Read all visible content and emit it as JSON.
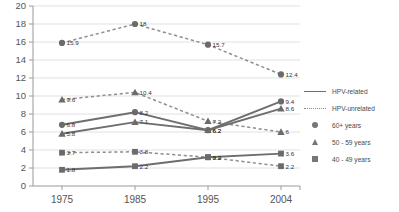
{
  "chart_data": {
    "type": "line",
    "title": "",
    "subtitle": "",
    "xlabel": "",
    "ylabel": "",
    "x": [
      "1975",
      "1985",
      "1995",
      "2004"
    ],
    "categories": [
      "1975",
      "1985",
      "1995",
      "2004"
    ],
    "ylim": [
      0,
      20
    ],
    "ytick_step": 2,
    "yticks": [
      "0",
      "2",
      "4",
      "6",
      "8",
      "10",
      "12",
      "14",
      "16",
      "18",
      "20"
    ],
    "grid": "horizontal",
    "legend_position": "right",
    "series": [
      {
        "name": "HPV-unrelated, 60+ years",
        "line_style": "dotted",
        "marker": "circle",
        "age_group": "60+ years",
        "relation": "HPV-unrelated",
        "values": [
          15.9,
          18,
          15.7,
          12.4
        ],
        "labels": [
          "15.9",
          "18",
          "15.7",
          "12.4"
        ]
      },
      {
        "name": "HPV-unrelated, 50 - 59 years",
        "line_style": "dotted",
        "marker": "triangle",
        "age_group": "50 - 59 years",
        "relation": "HPV-unrelated",
        "values": [
          9.6,
          10.4,
          7.2,
          6
        ],
        "labels": [
          "9.6",
          "10.4",
          "7.2",
          "6"
        ]
      },
      {
        "name": "HPV-related, 60+ years",
        "line_style": "solid",
        "marker": "circle",
        "age_group": "60+ years",
        "relation": "HPV-related",
        "values": [
          6.8,
          8.2,
          6.2,
          9.4
        ],
        "labels": [
          "6.8",
          "8.2",
          "6.2",
          "9.4"
        ]
      },
      {
        "name": "HPV-related, 50 - 59 years",
        "line_style": "solid",
        "marker": "triangle",
        "age_group": "50 - 59 years",
        "relation": "HPV-related",
        "values": [
          5.8,
          7.1,
          6.2,
          8.6
        ],
        "labels": [
          "5.8",
          "7.1",
          "6.2",
          "8.6"
        ]
      },
      {
        "name": "HPV-unrelated, 40 - 49 years",
        "line_style": "dotted",
        "marker": "square",
        "age_group": "40 - 49 years",
        "relation": "HPV-unrelated",
        "values": [
          3.7,
          3.8,
          3.2,
          2.2
        ],
        "labels": [
          "3.7",
          "3.8",
          "3.2",
          "2.2"
        ]
      },
      {
        "name": "HPV-related, 40 - 49 years",
        "line_style": "solid",
        "marker": "square",
        "age_group": "40 - 49 years",
        "relation": "HPV-related",
        "values": [
          1.8,
          2.2,
          3.2,
          3.6
        ],
        "labels": [
          "1.8",
          "2.2",
          "3.2",
          "3.6"
        ]
      }
    ]
  },
  "legend": {
    "items": [
      {
        "label": "HPV-related",
        "key": "solid-line-key",
        "icon": "line-solid-icon"
      },
      {
        "label": "HPV-unrelated",
        "key": "dotted-line-key",
        "icon": "line-dotted-icon"
      },
      {
        "label": "60+ years",
        "key": "circle-marker-key",
        "icon": "circle-marker-icon"
      },
      {
        "label": "50 - 59 years",
        "key": "triangle-marker-key",
        "icon": "triangle-marker-icon"
      },
      {
        "label": "40 - 49 years",
        "key": "square-marker-key",
        "icon": "square-marker-icon"
      }
    ]
  },
  "colors": {
    "solid_line": "#6e6e6e",
    "dotted_line": "#8f8f8f",
    "marker": "#6b6b6b",
    "grid": "#d9d9d9",
    "axis": "#9a9a9a",
    "text": "#4a4a4a"
  }
}
